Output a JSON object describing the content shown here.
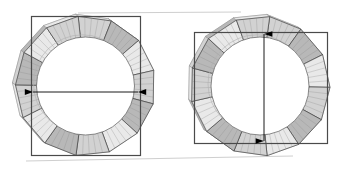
{
  "figure": {
    "type": "cad-orthographic-pair",
    "background_color": "#ffffff",
    "outline_color": "#3a3a3a",
    "segment_fill_light": "#e9e9e9",
    "segment_fill_mid": "#d2d2d2",
    "segment_fill_dark": "#b8b8b8",
    "hatch_color": "#8c8c8c",
    "arrow_color": "#000000",
    "leader_color": "#cfcfcf",
    "bbox_color": "#4a4a4a"
  },
  "views": [
    {
      "id": "left-view",
      "name": "left-ring-view",
      "label": "",
      "center": {
        "x": 85.5,
        "y": 86
      },
      "outer_radius": 70,
      "inner_radius": 49,
      "segments": 13,
      "rotation_deg": -6,
      "bbox": {
        "x": 31,
        "y": 16,
        "width": 109,
        "height": 139
      },
      "dimension": {
        "name": "outer-diameter-horizontal",
        "orientation": "horizontal",
        "value": "",
        "from": {
          "x": 33,
          "y": 92
        },
        "to": {
          "x": 138,
          "y": 92
        },
        "arrowheads": "both"
      }
    },
    {
      "id": "right-view",
      "name": "right-ring-view",
      "label": "",
      "center": {
        "x": 260,
        "y": 86
      },
      "outer_radius": 70,
      "inner_radius": 49,
      "segments": 13,
      "rotation_deg": 8,
      "bbox": {
        "x": 194,
        "y": 32,
        "width": 133,
        "height": 111
      },
      "dimension": {
        "name": "inner-height-vertical",
        "orientation": "vertical",
        "value": "",
        "from": {
          "x": 264,
          "y": 34
        },
        "to": {
          "x": 264,
          "y": 141
        },
        "arrowheads": "both"
      }
    }
  ],
  "leaders": [
    {
      "name": "top-leader-line",
      "x1": 78,
      "y1": 13,
      "x2": 241,
      "y2": 12
    },
    {
      "name": "bottom-leader-line",
      "x1": 26,
      "y1": 161,
      "x2": 293,
      "y2": 156
    }
  ]
}
